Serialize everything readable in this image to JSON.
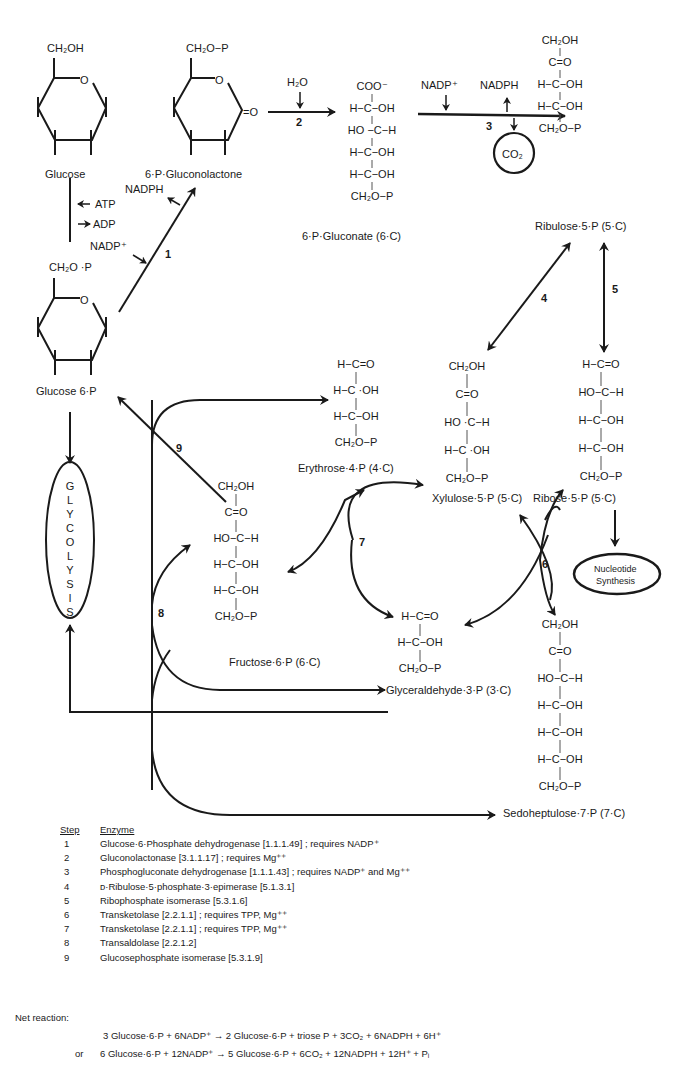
{
  "diagram": {
    "compounds": {
      "glucose": {
        "top": "CH₂OH",
        "name": "Glucose"
      },
      "gluconolactone": {
        "top": "CH₂O−P",
        "ketone": "=O",
        "name": "6·P·Gluconolactone"
      },
      "glucose6p": {
        "top": "CH₂O ·P",
        "name": "Glucose 6·P"
      },
      "gluconate": {
        "lines": [
          "COO⁻",
          "H−C−OH",
          "HO −C−H",
          "H−C−OH",
          "H−C−OH",
          "CH₂O−P"
        ],
        "name": "6·P·Gluconate (6·C)"
      },
      "ribulose5p": {
        "lines": [
          "CH₂OH",
          "C=O",
          "H−C−OH",
          "H−C−OH",
          "CH₂O−P"
        ],
        "name": "Ribulose·5·P (5·C)"
      },
      "erythrose4p": {
        "lines": [
          "H−C=O",
          "H−C ·OH",
          "H−C−OH",
          "CH₂O−P"
        ],
        "name": "Erythrose·4·P (4·C)"
      },
      "xylulose5p": {
        "lines": [
          "CH₂OH",
          "C=O",
          "HO ·C−H",
          "H−C ·OH",
          "CH₂O−P"
        ],
        "name": "Xylulose·5·P (5·C)"
      },
      "ribose5p": {
        "lines": [
          "H−C=O",
          "HO−C−H",
          "H−C−OH",
          "H−C−OH",
          "CH₂O−P"
        ],
        "name": "Ribose·5·P (5·C)"
      },
      "fructose6p": {
        "lines": [
          "CH₂OH",
          "C=O",
          "HO−C−H",
          "H−C−OH",
          "H−C−OH",
          "CH₂O−P"
        ],
        "name": "Fructose·6·P (6·C)"
      },
      "glyceraldehyde3p": {
        "lines": [
          "H−C=O",
          "H−C−OH",
          "CH₂O−P"
        ],
        "name": "Glyceraldehyde·3·P (3·C)"
      },
      "sedoheptulose7p": {
        "lines": [
          "CH₂OH",
          "C=O",
          "HO−C−H",
          "H−C−OH",
          "H−C−OH",
          "H−C−OH",
          "CH₂O−P"
        ],
        "name": "Sedoheptulose·7·P (7·C)"
      }
    },
    "cofactors": {
      "atp": "ATP",
      "adp": "ADP",
      "nadp_plus_1": "NADP⁺",
      "nadph_1": "NADPH",
      "h2o": "H₂O",
      "nadp_plus_3": "NADP⁺",
      "nadph_3": "NADPH",
      "co2": "CO₂"
    },
    "step_numbers": [
      "1",
      "2",
      "3",
      "4",
      "5",
      "6",
      "7",
      "8",
      "9"
    ],
    "glycolysis_letters": [
      "G",
      "L",
      "Y",
      "C",
      "O",
      "L",
      "Y",
      "S",
      "I",
      "S"
    ],
    "nucleotide": [
      "Nucleotide",
      "Synthesis"
    ]
  },
  "legend": {
    "header_step": "Step",
    "header_enzyme": "Enzyme",
    "rows": [
      {
        "step": "1",
        "enzyme": "Glucose·6·Phosphate dehydrogenase [1.1.1.49] ; requires NADP⁺"
      },
      {
        "step": "2",
        "enzyme": "Gluconolactonase [3.1.1.17] ; requires Mg⁺⁺"
      },
      {
        "step": "3",
        "enzyme": "Phosphogluconate dehydrogenase [1.1.1.43] ; requires NADP⁺ and Mg⁺⁺"
      },
      {
        "step": "4",
        "enzyme": "ᴅ·Ribulose·5·phosphate·3·epimerase [5.1.3.1]"
      },
      {
        "step": "5",
        "enzyme": "Ribophosphate isomerase [5.3.1.6]"
      },
      {
        "step": "6",
        "enzyme": "Transketolase [2.2.1.1] ; requires TPP, Mg⁺⁺"
      },
      {
        "step": "7",
        "enzyme": "Transketolase [2.2.1.1] ; requires TPP, Mg⁺⁺"
      },
      {
        "step": "8",
        "enzyme": "Transaldolase [2.2.1.2]"
      },
      {
        "step": "9",
        "enzyme": "Glucosephosphate isomerase [5.3.1.9]"
      }
    ]
  },
  "net_reaction": {
    "label": "Net reaction:",
    "line1": "3 Glucose·6·P + 6NADP⁺ → 2 Glucose·6·P + triose P + 3CO₂ + 6NADPH + 6H⁺",
    "or": "or",
    "line2": "6 Glucose·6·P + 12NADP⁺ →  5 Glucose·6·P + 6CO₂ + 12NADPH + 12H⁺ + Pᵢ"
  }
}
